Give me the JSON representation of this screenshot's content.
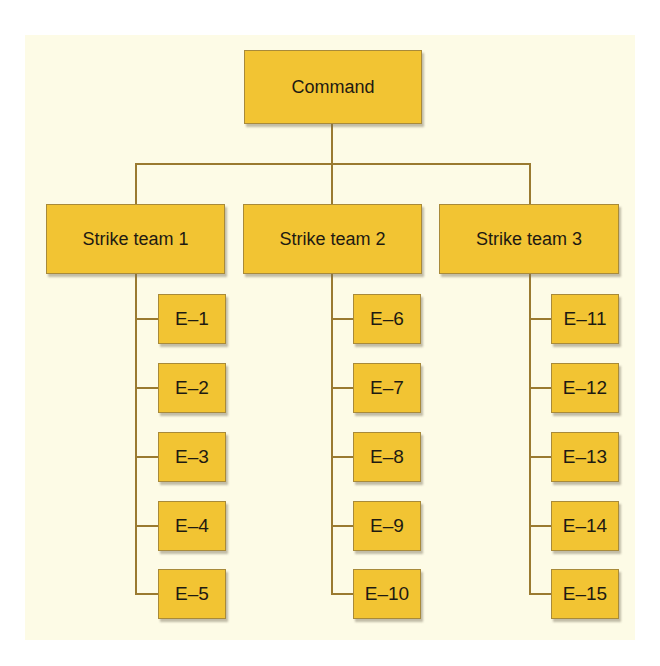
{
  "diagram": {
    "type": "org-chart",
    "colors": {
      "background": "#fdfbe6",
      "box_fill": "#f2c433",
      "box_border": "#a88a3a",
      "connector": "#9a7a30",
      "text": "#1e1a12"
    },
    "root": {
      "label": "Command"
    },
    "teams": [
      {
        "label": "Strike team 1",
        "elements": [
          "E–1",
          "E–2",
          "E–3",
          "E–4",
          "E–5"
        ]
      },
      {
        "label": "Strike team 2",
        "elements": [
          "E–6",
          "E–7",
          "E–8",
          "E–9",
          "E–10"
        ]
      },
      {
        "label": "Strike team 3",
        "elements": [
          "E–11",
          "E–12",
          "E–13",
          "E–14",
          "E–15"
        ]
      }
    ]
  }
}
